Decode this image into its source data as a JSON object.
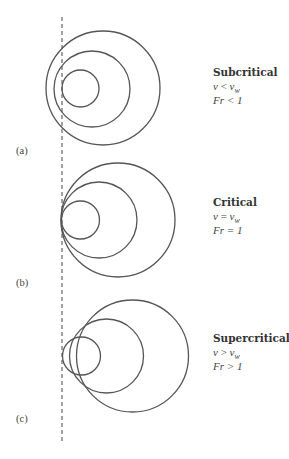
{
  "figure": {
    "wall_line": {
      "x": 62,
      "y1": 17,
      "y2": 444,
      "style": "dashed"
    },
    "panels": [
      {
        "id": "a",
        "label": "(a)",
        "label_pos": {
          "x": 16,
          "y": 154
        },
        "regime": "Subcritical",
        "relation": {
          "lhs": "v",
          "op": "<",
          "rhs": "v",
          "rhs_sub": "w"
        },
        "froude": "Fr < 1",
        "text_pos": {
          "x": 213,
          "y": 76
        },
        "circles": [
          {
            "cx": 103,
            "cy": 88,
            "r": 57
          },
          {
            "cx": 92,
            "cy": 89,
            "r": 38
          },
          {
            "cx": 80.5,
            "cy": 88.5,
            "r": 18.5
          }
        ]
      },
      {
        "id": "b",
        "label": "(b)",
        "label_pos": {
          "x": 16,
          "y": 286
        },
        "regime": "Critical",
        "relation": {
          "lhs": "v",
          "op": "=",
          "rhs": "v",
          "rhs_sub": "w"
        },
        "froude": "Fr = 1",
        "text_pos": {
          "x": 213,
          "y": 206
        },
        "circles": [
          {
            "cx": 118,
            "cy": 220,
            "r": 57
          },
          {
            "cx": 99,
            "cy": 220,
            "r": 38
          },
          {
            "cx": 80.5,
            "cy": 220,
            "r": 19
          }
        ]
      },
      {
        "id": "c",
        "label": "(c)",
        "label_pos": {
          "x": 16,
          "y": 422
        },
        "regime": "Supercritical",
        "relation": {
          "lhs": "v",
          "op": ">",
          "rhs": "v",
          "rhs_sub": "w"
        },
        "froude": "Fr > 1",
        "text_pos": {
          "x": 213,
          "y": 342
        },
        "circles": [
          {
            "cx": 132.5,
            "cy": 356,
            "r": 56
          },
          {
            "cx": 106.5,
            "cy": 356,
            "r": 37
          },
          {
            "cx": 81.5,
            "cy": 356,
            "r": 19
          }
        ]
      }
    ]
  },
  "labels": {
    "a": {
      "panel": "(a)",
      "title": "Subcritical",
      "lhs": "v",
      "op": " < ",
      "rhs": "v",
      "sub": "w",
      "froude": "Fr < 1"
    },
    "b": {
      "panel": "(b)",
      "title": "Critical",
      "lhs": "v",
      "op": " = ",
      "rhs": "v",
      "sub": "w",
      "froude": "Fr = 1"
    },
    "c": {
      "panel": "(c)",
      "title": "Supercritical",
      "lhs": "v",
      "op": " > ",
      "rhs": "v",
      "sub": "w",
      "froude": "Fr > 1"
    }
  }
}
